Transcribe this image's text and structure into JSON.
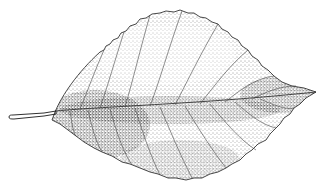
{
  "image": {
    "subject": "leaf",
    "style": "stippled pen-and-ink botanical illustration",
    "colors": {
      "ink": "#1a1a1a",
      "paper": "#ffffff"
    }
  }
}
